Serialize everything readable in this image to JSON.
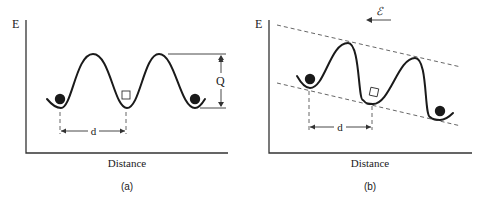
{
  "figure": {
    "panels": [
      {
        "id": "a",
        "y_axis_label": "E",
        "x_axis_label": "Distance",
        "caption": "(a)",
        "barrier_height_label": "Q",
        "spacing_label": "d",
        "description": "Periodic energy landscape with equal barriers; filled circles are atoms in wells, open square is a vacancy"
      },
      {
        "id": "b",
        "y_axis_label": "E",
        "x_axis_label": "Distance",
        "caption": "(b)",
        "spacing_label": "d",
        "field_label": "ℰ",
        "field_direction": "left",
        "description": "Energy landscape tilted by an applied field; dashed envelope lines slope downward to the right"
      }
    ],
    "colors": {
      "ink": "#1a1a1a",
      "background": "#ffffff"
    }
  }
}
